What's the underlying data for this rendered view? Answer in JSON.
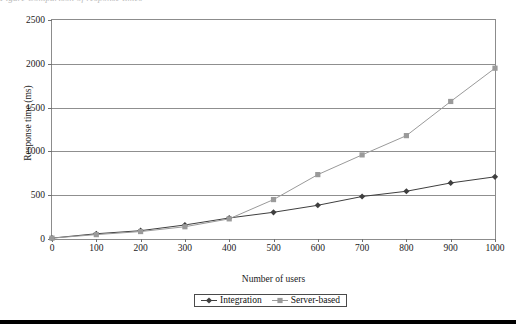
{
  "caption_remnant": "Figure   Comparison of response times",
  "chart_data": {
    "type": "line",
    "title": "",
    "xlabel": "Number of users",
    "ylabel": "Response time (ms)",
    "x": [
      0,
      100,
      200,
      300,
      400,
      500,
      600,
      700,
      800,
      900,
      1000
    ],
    "xlim": [
      0,
      1000
    ],
    "ylim": [
      0,
      2500
    ],
    "xticks": [
      "0",
      "100",
      "200",
      "300",
      "400",
      "500",
      "600",
      "700",
      "800",
      "900",
      "1000"
    ],
    "yticks": [
      "0",
      "500",
      "1000",
      "1500",
      "2000",
      "2500"
    ],
    "grid": "horizontal",
    "legend_position": "below-axis-center",
    "series": [
      {
        "name": "Integration",
        "marker": "diamond",
        "color": "#3f3f3f",
        "values": [
          10,
          60,
          95,
          160,
          240,
          305,
          385,
          485,
          545,
          640,
          710
        ]
      },
      {
        "name": "Server-based",
        "marker": "square",
        "color": "#9a9a9a",
        "values": [
          10,
          50,
          85,
          140,
          230,
          450,
          735,
          960,
          1180,
          1570,
          1950
        ]
      }
    ]
  },
  "legend": {
    "items": [
      {
        "label": "Integration"
      },
      {
        "label": "Server-based"
      }
    ]
  }
}
